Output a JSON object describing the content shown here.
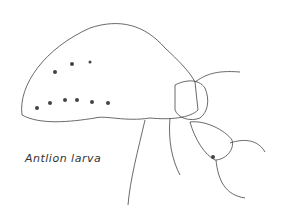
{
  "caption": "Antlion larva",
  "colors": {
    "ink": "#333333",
    "spots": "#444444",
    "background": "#ffffff"
  }
}
